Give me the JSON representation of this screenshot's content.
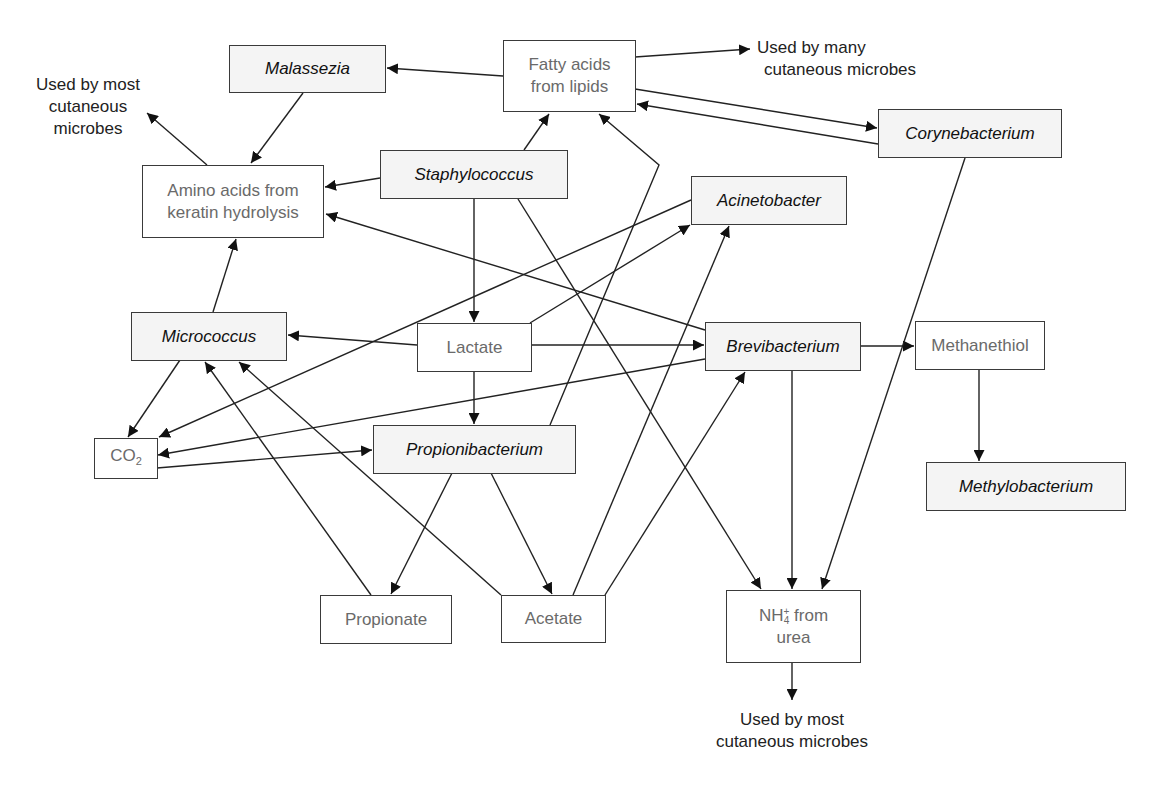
{
  "diagram": {
    "title": "",
    "nodes": {
      "malassezia": {
        "label": "Malassezia",
        "kind": "organism"
      },
      "fatty_acids": {
        "line1": "Fatty acids",
        "line2": "from lipids",
        "kind": "metabolite"
      },
      "corynebacterium": {
        "label": "Corynebacterium",
        "kind": "organism"
      },
      "amino_acids": {
        "line1": "Amino acids from",
        "line2": "keratin hydrolysis",
        "kind": "metabolite"
      },
      "staphylococcus": {
        "label": "Staphylococcus",
        "kind": "organism"
      },
      "acinetobacter": {
        "label": "Acinetobacter",
        "kind": "organism"
      },
      "micrococcus": {
        "label": "Micrococcus",
        "kind": "organism"
      },
      "lactate": {
        "label": "Lactate",
        "kind": "metabolite"
      },
      "brevibacterium": {
        "label": "Brevibacterium",
        "kind": "organism"
      },
      "methanethiol": {
        "label": "Methanethiol",
        "kind": "metabolite"
      },
      "methylobacterium": {
        "label": "Methylobacterium",
        "kind": "organism"
      },
      "co2": {
        "base": "CO",
        "sub": "2",
        "kind": "metabolite"
      },
      "propionibacterium": {
        "label": "Propionibacterium",
        "kind": "organism"
      },
      "propionate": {
        "label": "Propionate",
        "kind": "metabolite"
      },
      "acetate": {
        "label": "Acetate",
        "kind": "metabolite"
      },
      "nh4": {
        "base": "NH",
        "sup": "+",
        "sub": "4",
        "rest": " from",
        "line2": "urea",
        "kind": "metabolite"
      }
    },
    "notes": {
      "top_left": {
        "line1": "Used by most",
        "line2": "cutaneous",
        "line3": "microbes"
      },
      "top_right": {
        "line1": "Used by many",
        "line2": "cutaneous microbes"
      },
      "bottom": {
        "line1": "Used by most",
        "line2": "cutaneous microbes"
      }
    },
    "edges": [
      {
        "from": "fatty_acids",
        "to": "malassezia"
      },
      {
        "from": "fatty_acids",
        "to": "note_top_right"
      },
      {
        "from": "fatty_acids",
        "to": "corynebacterium"
      },
      {
        "from": "corynebacterium",
        "to": "fatty_acids"
      },
      {
        "from": "malassezia",
        "to": "amino_acids"
      },
      {
        "from": "amino_acids",
        "to": "note_top_left"
      },
      {
        "from": "staphylococcus",
        "to": "amino_acids"
      },
      {
        "from": "staphylococcus",
        "to": "fatty_acids"
      },
      {
        "from": "staphylococcus",
        "to": "lactate"
      },
      {
        "from": "staphylococcus",
        "to": "nh4"
      },
      {
        "from": "brevibacterium",
        "to": "amino_acids"
      },
      {
        "from": "micrococcus",
        "to": "amino_acids"
      },
      {
        "from": "lactate",
        "to": "micrococcus"
      },
      {
        "from": "lactate",
        "to": "acinetobacter"
      },
      {
        "from": "lactate",
        "to": "brevibacterium"
      },
      {
        "from": "lactate",
        "to": "propionibacterium"
      },
      {
        "from": "acinetobacter",
        "to": "co2"
      },
      {
        "from": "micrococcus",
        "to": "co2"
      },
      {
        "from": "brevibacterium",
        "to": "co2"
      },
      {
        "from": "co2",
        "to": "propionibacterium"
      },
      {
        "from": "brevibacterium",
        "to": "methanethiol"
      },
      {
        "from": "methanethiol",
        "to": "methylobacterium"
      },
      {
        "from": "brevibacterium",
        "to": "nh4"
      },
      {
        "from": "corynebacterium",
        "to": "nh4"
      },
      {
        "from": "propionibacterium",
        "to": "fatty_acids"
      },
      {
        "from": "propionibacterium",
        "to": "propionate"
      },
      {
        "from": "propionibacterium",
        "to": "acetate"
      },
      {
        "from": "propionate",
        "to": "micrococcus"
      },
      {
        "from": "acetate",
        "to": "micrococcus"
      },
      {
        "from": "acetate",
        "to": "acinetobacter"
      },
      {
        "from": "acetate",
        "to": "brevibacterium"
      },
      {
        "from": "nh4",
        "to": "note_bottom"
      }
    ]
  }
}
